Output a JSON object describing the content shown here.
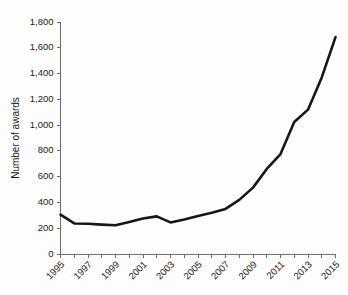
{
  "chart_data": {
    "type": "line",
    "title": "",
    "xlabel": "",
    "ylabel": "Number of awards",
    "xlim": [
      1995,
      2015
    ],
    "ylim": [
      0,
      1800
    ],
    "grid": false,
    "legend": "none",
    "line_color": "#171717",
    "axis_color": "#6e6e6e",
    "background_color": "#fdfdfd",
    "y_ticks": [
      0,
      200,
      400,
      600,
      800,
      1000,
      1200,
      1400,
      1600,
      1800
    ],
    "y_tick_labels": [
      "0",
      "200",
      "400",
      "600",
      "800",
      "1,000",
      "1,200",
      "1,400",
      "1,600",
      "1,800"
    ],
    "x_ticks": [
      1995,
      1996,
      1997,
      1998,
      1999,
      2000,
      2001,
      2002,
      2003,
      2004,
      2005,
      2006,
      2007,
      2008,
      2009,
      2010,
      2011,
      2012,
      2013,
      2014,
      2015
    ],
    "x_tick_labels": [
      "1995",
      "",
      "1997",
      "",
      "1999",
      "",
      "2001",
      "",
      "2003",
      "",
      "2005",
      "",
      "2007",
      "",
      "2009",
      "",
      "2011",
      "",
      "2013",
      "",
      "2015"
    ],
    "x_label_rotation": -45,
    "series": [
      {
        "name": "Number of awards",
        "x": [
          1995,
          1996,
          1997,
          1998,
          1999,
          2000,
          2001,
          2002,
          2003,
          2004,
          2005,
          2006,
          2007,
          2008,
          2009,
          2010,
          2011,
          2012,
          2013,
          2014,
          2015
        ],
        "values": [
          305,
          237,
          235,
          228,
          223,
          248,
          275,
          292,
          245,
          268,
          295,
          320,
          350,
          420,
          515,
          660,
          775,
          1024,
          1120,
          1370,
          1683
        ]
      }
    ]
  },
  "axes": {
    "y_title": "Number of awards"
  }
}
